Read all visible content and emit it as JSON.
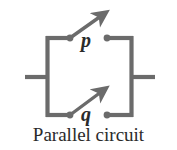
{
  "figure": {
    "caption": "Parallel circuit",
    "type": "circuit-diagram",
    "background_color": "#ffffff",
    "wire_color": "#6b6b6b",
    "label_color": "#2b2b2b",
    "caption_color": "#2b2b2b"
  },
  "circuit": {
    "topology": "parallel",
    "switches": [
      {
        "id": "p",
        "label": "p",
        "branch": "top",
        "state": "open",
        "pivot": {
          "x": 70,
          "y": 38
        },
        "contact": {
          "x": 107,
          "y": 38
        },
        "lever_tip": {
          "x": 106,
          "y": 12
        },
        "label_position": {
          "x": 81,
          "y": 30
        }
      },
      {
        "id": "q",
        "label": "q",
        "branch": "bottom",
        "state": "open",
        "pivot": {
          "x": 70,
          "y": 115
        },
        "contact": {
          "x": 107,
          "y": 115
        },
        "lever_tip": {
          "x": 106,
          "y": 87
        },
        "label_position": {
          "x": 81,
          "y": 104
        }
      }
    ],
    "rails": {
      "left_x": 47,
      "right_x": 132,
      "top_y": 38,
      "bottom_y": 115,
      "mid_y": 77
    },
    "leads": [
      {
        "name": "left-lead",
        "x1": 25,
        "y1": 77,
        "x2": 47,
        "y2": 77
      },
      {
        "name": "right-lead",
        "x1": 132,
        "y1": 77,
        "x2": 155,
        "y2": 77
      }
    ]
  }
}
